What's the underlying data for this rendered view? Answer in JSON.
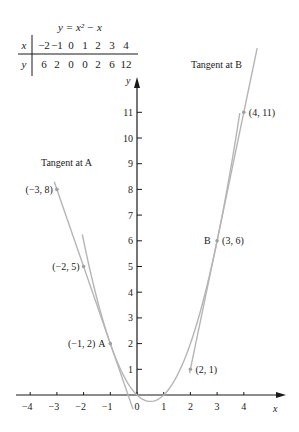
{
  "chart_data": {
    "type": "line",
    "title": "",
    "xlabel": "x",
    "ylabel": "y",
    "xlim": [
      -4.4,
      5.6
    ],
    "ylim": [
      -0.6,
      12.2
    ],
    "grid": false,
    "x_ticks": [
      -4,
      -3,
      -2,
      -1,
      0,
      1,
      2,
      3,
      4
    ],
    "y_ticks": [
      1,
      2,
      3,
      4,
      5,
      6,
      7,
      8,
      9,
      10,
      11
    ],
    "table": {
      "title": "y = x² − x",
      "x_label": "x",
      "y_label": "y",
      "x_values": [
        -2,
        -1,
        0,
        1,
        2,
        3,
        4
      ],
      "y_values": [
        6,
        2,
        0,
        0,
        2,
        6,
        12
      ]
    },
    "series": [
      {
        "name": "y = x^2 - x",
        "kind": "curve",
        "x_range": [
          -2.05,
          3.85
        ]
      },
      {
        "name": "Tangent at A",
        "kind": "line",
        "slope": -3,
        "intercept": -1,
        "x_range": [
          -3.1,
          -0.15
        ]
      },
      {
        "name": "Tangent at B",
        "kind": "line",
        "slope": 5,
        "intercept": -9,
        "x_range": [
          1.97,
          4.5
        ]
      }
    ],
    "points": [
      {
        "label": "(−3, 8)",
        "x": -3,
        "y": 8
      },
      {
        "label": "(−2, 5)",
        "x": -2,
        "y": 5
      },
      {
        "label": "(−1, 2)",
        "x": -1,
        "y": 2,
        "name": "A"
      },
      {
        "label": "(2, 1)",
        "x": 2,
        "y": 1
      },
      {
        "label": "(3, 6)",
        "x": 3,
        "y": 6,
        "name": "B"
      },
      {
        "label": "(4, 11)",
        "x": 4,
        "y": 11
      }
    ],
    "annotations": [
      {
        "text": "Tangent at A",
        "x": -3.6,
        "y": 9.0
      },
      {
        "text": "Tangent at B",
        "x": 2.0,
        "y": 12.8
      }
    ]
  },
  "labels": {
    "table_title": "y = x² − x",
    "tangent_a": "Tangent at A",
    "tangent_b": "Tangent at B",
    "point_A": "A",
    "point_B": "B",
    "axis_x": "x",
    "axis_y": "y"
  },
  "colors": {
    "axis": "#1a1a1a",
    "curve": "#b5b5b5",
    "point": "#a0a0a0",
    "text": "#1a1a1a"
  }
}
